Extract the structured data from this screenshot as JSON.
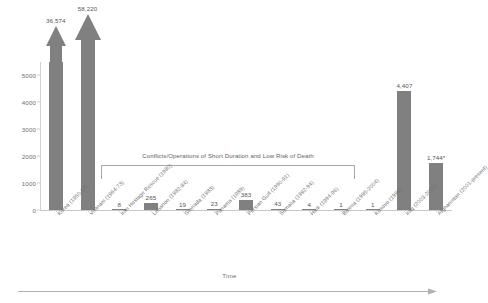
{
  "chart_data": {
    "type": "bar",
    "title": "",
    "xlabel": "Time",
    "ylabel": "",
    "ylim": [
      0,
      5500
    ],
    "grid": false,
    "legend": null,
    "yticks": [
      "0",
      "1000",
      "2000",
      "3000",
      "4000",
      "5000"
    ],
    "ytick_values": [
      0,
      1000,
      2000,
      3000,
      4000,
      5000
    ],
    "categories": [
      "Korea (1950-53)",
      "Vietnam (1964-73)",
      "Iran Hostage Rescue (1980)",
      "Lebanon (1982-84)",
      "Grenada (1983)",
      "Panama (1989)",
      "Persian Gulf (1990-91)",
      "Somalia (1992-94)",
      "Haiti (1994-96)",
      "Bosnia (1995-2004)",
      "Kosovo (1999)",
      "Iraq (2003-2010)",
      "Afghanistan (2001-present)"
    ],
    "values": [
      36574,
      58220,
      8,
      265,
      19,
      23,
      383,
      43,
      4,
      1,
      1,
      4407,
      1744
    ],
    "data_labels": [
      "36,574",
      "58,220",
      "8",
      "265",
      "19",
      "23",
      "383",
      "43",
      "4",
      "1",
      "1",
      "4,407",
      "1,744*"
    ],
    "truncated_bars": [
      {
        "category": "Korea (1950-53)",
        "label": "36,574"
      },
      {
        "category": "Vietnam (1964-73)",
        "label": "58,220"
      }
    ],
    "annotations": [
      {
        "text": "Conflicts/Operations of Short Duration and Low Risk of Death",
        "covers_categories": [
          "Iran Hostage Rescue (1980)",
          "Lebanon (1982-84)",
          "Grenada (1983)",
          "Panama (1989)",
          "Persian Gulf (1990-91)",
          "Somalia (1992-94)",
          "Haiti (1994-96)",
          "Bosnia (1995-2004)",
          "Kosovo (1999)"
        ]
      }
    ]
  },
  "colors": {
    "bar": "#808080",
    "axis": "#c8c8c8",
    "text": "#6f6f6f",
    "bracket": "#a8a8a8"
  }
}
